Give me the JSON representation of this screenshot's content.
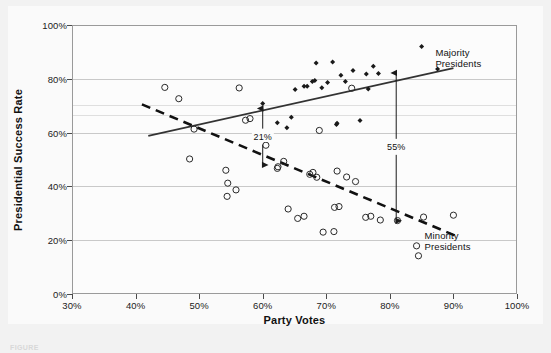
{
  "figure": {
    "caption": "FIGURE",
    "background_color": "#f2f2f2",
    "plot_background_color": "#fcfcfc"
  },
  "chart_data": {
    "type": "scatter",
    "title": "",
    "xlabel": "Party Votes",
    "ylabel": "Presidential Success Rate",
    "xlim": [
      30,
      100
    ],
    "ylim": [
      0,
      100
    ],
    "xticks": [
      "30%",
      "40%",
      "50%",
      "60%",
      "70%",
      "80%",
      "90%",
      "100%"
    ],
    "xtick_values": [
      30,
      40,
      50,
      60,
      70,
      80,
      90,
      100
    ],
    "yticks": [
      "0%",
      "20%",
      "40%",
      "60%",
      "80%",
      "100%"
    ],
    "ytick_values": [
      0,
      20,
      40,
      60,
      80,
      100
    ],
    "grid": "horizontal",
    "legend_position": "inline-right",
    "series": [
      {
        "name": "Majority Presidents",
        "marker": "filled-diamond",
        "color": "#1a1a1a",
        "points": [
          [
            60.0,
            70.8
          ],
          [
            62.3,
            63.7
          ],
          [
            63.8,
            61.8
          ],
          [
            64.5,
            65.7
          ],
          [
            65.1,
            76.0
          ],
          [
            66.5,
            77.2
          ],
          [
            67.0,
            77.2
          ],
          [
            67.8,
            79.0
          ],
          [
            68.2,
            79.4
          ],
          [
            68.4,
            85.9
          ],
          [
            69.3,
            76.7
          ],
          [
            70.2,
            78.6
          ],
          [
            71.0,
            86.2
          ],
          [
            71.6,
            63.0
          ],
          [
            71.7,
            63.5
          ],
          [
            72.3,
            81.3
          ],
          [
            73.0,
            79.0
          ],
          [
            74.2,
            83.1
          ],
          [
            75.3,
            64.5
          ],
          [
            76.3,
            81.8
          ],
          [
            76.6,
            76.2
          ],
          [
            77.4,
            84.7
          ],
          [
            78.2,
            82.0
          ],
          [
            85.0,
            92.0
          ],
          [
            87.5,
            83.6
          ]
        ]
      },
      {
        "name": "Minority Presidents",
        "marker": "open-circle",
        "color": "#2a2a2a",
        "points": [
          [
            44.6,
            76.8
          ],
          [
            46.8,
            72.6
          ],
          [
            49.2,
            61.3
          ],
          [
            48.5,
            50.2
          ],
          [
            54.5,
            41.2
          ],
          [
            54.4,
            36.3
          ],
          [
            54.2,
            46.0
          ],
          [
            55.8,
            38.7
          ],
          [
            56.3,
            76.6
          ],
          [
            57.3,
            64.6
          ],
          [
            58.0,
            65.2
          ],
          [
            60.5,
            55.3
          ],
          [
            62.4,
            47.3
          ],
          [
            62.3,
            46.7
          ],
          [
            63.3,
            49.3
          ],
          [
            64.0,
            31.6
          ],
          [
            65.5,
            28.1
          ],
          [
            66.5,
            28.9
          ],
          [
            67.4,
            44.5
          ],
          [
            67.9,
            45.2
          ],
          [
            68.5,
            43.4
          ],
          [
            68.9,
            60.8
          ],
          [
            69.5,
            23.0
          ],
          [
            71.2,
            23.2
          ],
          [
            71.3,
            32.2
          ],
          [
            71.7,
            45.7
          ],
          [
            72.0,
            32.5
          ],
          [
            73.2,
            43.5
          ],
          [
            74.0,
            76.5
          ],
          [
            74.6,
            41.8
          ],
          [
            76.2,
            28.5
          ],
          [
            77.0,
            28.9
          ],
          [
            78.5,
            27.5
          ],
          [
            81.2,
            27.3
          ],
          [
            84.2,
            17.9
          ],
          [
            84.5,
            14.2
          ],
          [
            85.3,
            28.6
          ],
          [
            90.0,
            29.3
          ]
        ]
      }
    ],
    "trend_lines": [
      {
        "name": "Majority Presidents",
        "style": "solid",
        "color": "#333333",
        "start": [
          42.0,
          58.8
        ],
        "end": [
          90.0,
          84.0
        ],
        "label": "Majority\nPresidents",
        "label_line1": "Majority",
        "label_line2": "Presidents"
      },
      {
        "name": "Minority Presidents",
        "style": "dashed",
        "color": "#111111",
        "start": [
          41.0,
          70.5
        ],
        "end": [
          90.5,
          21.5
        ],
        "label_line1": "Minority",
        "label_line2": "Presidents"
      }
    ],
    "annotations": [
      {
        "label": "21%",
        "x": 60.0,
        "y_top": 69.0,
        "y_bottom": 48.0,
        "arrow": "double-headed-vertical"
      },
      {
        "label": "55%",
        "x": 81.0,
        "y_top": 82.2,
        "y_bottom": 27.2,
        "arrow": "double-headed-vertical"
      }
    ]
  }
}
